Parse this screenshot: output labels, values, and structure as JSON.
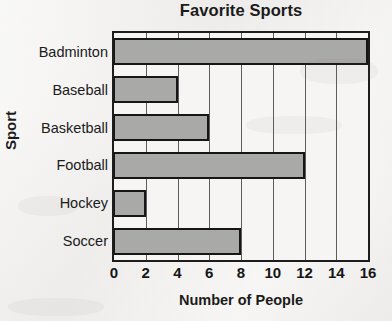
{
  "chart_data": {
    "type": "bar",
    "orientation": "horizontal",
    "title": "Favorite Sports",
    "xlabel": "Number of People",
    "ylabel": "Sport",
    "categories": [
      "Badminton",
      "Baseball",
      "Basketball",
      "Football",
      "Hockey",
      "Soccer"
    ],
    "values": [
      16,
      4,
      6,
      12,
      2,
      8
    ],
    "xlim": [
      0,
      16
    ],
    "xticks": [
      0,
      2,
      4,
      6,
      8,
      10,
      12,
      14,
      16
    ],
    "xtick_labels": [
      "0",
      "2",
      "4",
      "6",
      "8",
      "10",
      "12",
      "14",
      "16"
    ],
    "xtick_step": 2,
    "grid": true,
    "grid_axis": "x",
    "legend": false,
    "bar_fill_color": "#a9a9a8",
    "bar_border_color": "#161616",
    "plot_background_color": "#f6f5f3",
    "axis_color": "#1d1d1d",
    "gridline_color": "#5d5d5d",
    "text_color": "#1b1b1b",
    "page_background_color": "#f1f0ee"
  }
}
